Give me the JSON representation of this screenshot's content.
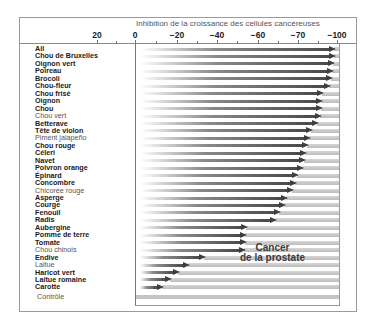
{
  "chart_data": {
    "type": "bar",
    "orientation": "horizontal",
    "title": "Inhibition de la croissance des cellules cancéreuses",
    "annotation": [
      "Cancer",
      "de la prostate"
    ],
    "xlabel": "Inhibition de la croissance des cellules cancéreuses",
    "ylabel": "",
    "x_tick_labels": [
      "20",
      "0",
      "−20",
      "−40",
      "−60",
      "−70",
      "−100"
    ],
    "xlim": [
      20,
      -100
    ],
    "grid": false,
    "legend": null,
    "categories": [
      "Ail",
      "Chou de Bruxelles",
      "Oignon vert",
      "Poireau",
      "Brocoli",
      "Chou-fleur",
      "Chou frisé",
      "Oignon",
      "Chou",
      "Chou vert",
      "Betterave",
      "Tête de violon",
      "Piment jalapeño",
      "Chou rouge",
      "Céleri",
      "Navet",
      "Poivron orange",
      "Épinard",
      "Concombre",
      "Chicorée rouge",
      "Asperge",
      "Courge",
      "Fenouil",
      "Radis",
      "Aubergine",
      "Pomme de terre",
      "Tomate",
      "Chou chinois",
      "Endive",
      "Laitue",
      "Haricot vert",
      "Laitue romaine",
      "Carotte",
      "Contrôle"
    ],
    "values": [
      -99,
      -99,
      -98,
      -97,
      -95,
      -91,
      -80,
      -78,
      -78,
      -76,
      -74,
      -70,
      -69,
      -68,
      -67,
      -66,
      -64,
      -60,
      -59,
      -57,
      -54,
      -53,
      -51,
      -49,
      -35,
      -35,
      -35,
      -34,
      -15,
      -7,
      -2,
      0,
      0,
      0
    ]
  },
  "rows": [
    {
      "label": "Ail",
      "tip": 336,
      "light": false
    },
    {
      "label": "Chou de Bruxelles",
      "tip": 336,
      "light": false
    },
    {
      "label": "Oignon vert",
      "tip": 335,
      "light": false
    },
    {
      "label": "Poireau",
      "tip": 334,
      "light": false
    },
    {
      "label": "Brocoli",
      "tip": 333,
      "light": false
    },
    {
      "label": "Chou-fleur",
      "tip": 331,
      "light": false
    },
    {
      "label": "Chou frisé",
      "tip": 324,
      "light": false
    },
    {
      "label": "Oignon",
      "tip": 323,
      "light": false
    },
    {
      "label": "Chou",
      "tip": 323,
      "light": false
    },
    {
      "label": "Chou vert",
      "tip": 322,
      "light": true
    },
    {
      "label": "Betterave",
      "tip": 319,
      "light": false
    },
    {
      "label": "Tête de violon",
      "tip": 313,
      "light": false
    },
    {
      "label": "Piment jalapeño",
      "tip": 311,
      "light": true
    },
    {
      "label": "Chou rouge",
      "tip": 309,
      "light": false
    },
    {
      "label": "Céleri",
      "tip": 307,
      "light": false
    },
    {
      "label": "Navet",
      "tip": 306,
      "light": false
    },
    {
      "label": "Poivron orange",
      "tip": 304,
      "light": false
    },
    {
      "label": "Épinard",
      "tip": 299,
      "light": false
    },
    {
      "label": "Concombre",
      "tip": 297,
      "light": false
    },
    {
      "label": "Chicorée rouge",
      "tip": 294,
      "light": true
    },
    {
      "label": "Asperge",
      "tip": 288,
      "light": false
    },
    {
      "label": "Courge",
      "tip": 286,
      "light": false
    },
    {
      "label": "Fenouil",
      "tip": 281,
      "light": false
    },
    {
      "label": "Radis",
      "tip": 277,
      "light": false
    },
    {
      "label": "Aubergine",
      "tip": 248,
      "light": false
    },
    {
      "label": "Pomme de terre",
      "tip": 247,
      "light": false
    },
    {
      "label": "Tomate",
      "tip": 247,
      "light": false
    },
    {
      "label": "Chou chinois",
      "tip": 246,
      "light": true
    },
    {
      "label": "Endive",
      "tip": 206,
      "light": false
    },
    {
      "label": "Laitue",
      "tip": 190,
      "light": true
    },
    {
      "label": "Haricot vert",
      "tip": 180,
      "light": false
    },
    {
      "label": "Laitue romaine",
      "tip": 172,
      "light": false
    },
    {
      "label": "Carotte",
      "tip": 164,
      "light": false
    }
  ],
  "control": {
    "label": "Contrôle"
  },
  "axis": {
    "title": "Inhibition de la croissance des cellules cancéreuses",
    "ticks": [
      {
        "label": "20",
        "x": 97
      },
      {
        "label": "0",
        "x": 135
      },
      {
        "label": "−20",
        "x": 177
      },
      {
        "label": "−40",
        "x": 217
      },
      {
        "label": "−60",
        "x": 258
      },
      {
        "label": "−70",
        "x": 298
      },
      {
        "label": "−100",
        "x": 337
      }
    ],
    "minor_ticks": [
      116,
      156,
      197,
      237,
      278,
      318
    ]
  },
  "annotation": {
    "line1": "Cancer",
    "line2": "de la prostate"
  }
}
